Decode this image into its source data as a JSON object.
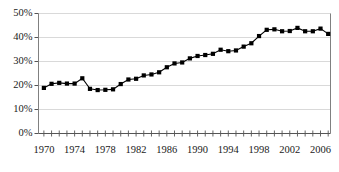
{
  "chart_data": {
    "type": "line",
    "title": "",
    "subtitle": "",
    "xlabel": "",
    "ylabel": "",
    "grid": true,
    "legend": false,
    "marker": "square",
    "line_color": "#000000",
    "marker_color": "#000000",
    "grid_color": "#d9d9d9",
    "axis_color": "#808080",
    "xlim": [
      1969.3,
      2007.3
    ],
    "ylim": [
      0,
      50
    ],
    "ytick_labels": [
      "0%",
      "10%",
      "20%",
      "30%",
      "40%",
      "50%"
    ],
    "ytick_values": [
      0,
      10,
      20,
      30,
      40,
      50
    ],
    "xtick_labels": [
      "1970",
      "1974",
      "1978",
      "1982",
      "1986",
      "1990",
      "1994",
      "1998",
      "2002",
      "2006"
    ],
    "xtick_values": [
      1970,
      1974,
      1978,
      1982,
      1986,
      1990,
      1994,
      1998,
      2002,
      2006
    ],
    "x": [
      1970,
      1971,
      1972,
      1973,
      1974,
      1975,
      1976,
      1977,
      1978,
      1979,
      1980,
      1981,
      1982,
      1983,
      1984,
      1985,
      1986,
      1987,
      1988,
      1989,
      1990,
      1991,
      1992,
      1993,
      1994,
      1995,
      1996,
      1997,
      1998,
      1999,
      2000,
      2001,
      2002,
      2003,
      2004,
      2005,
      2006,
      2007
    ],
    "values": [
      19.0,
      20.7,
      21.1,
      20.8,
      20.8,
      23.0,
      18.6,
      18.1,
      18.2,
      18.4,
      20.6,
      22.5,
      22.8,
      24.2,
      24.6,
      25.5,
      27.6,
      29.2,
      29.6,
      31.3,
      32.3,
      32.7,
      33.2,
      34.9,
      34.3,
      34.6,
      36.2,
      37.6,
      40.6,
      43.2,
      43.4,
      42.6,
      42.7,
      44.0,
      42.6,
      42.6,
      43.7,
      41.5
    ],
    "series": [
      {
        "name": "",
        "values": [
          19.0,
          20.7,
          21.1,
          20.8,
          20.8,
          23.0,
          18.6,
          18.1,
          18.2,
          18.4,
          20.6,
          22.5,
          22.8,
          24.2,
          24.6,
          25.5,
          27.6,
          29.2,
          29.6,
          31.3,
          32.3,
          32.7,
          33.2,
          34.9,
          34.3,
          34.6,
          36.2,
          37.6,
          40.6,
          43.2,
          43.4,
          42.6,
          42.7,
          44.0,
          42.6,
          42.6,
          43.7,
          41.5
        ]
      }
    ]
  }
}
